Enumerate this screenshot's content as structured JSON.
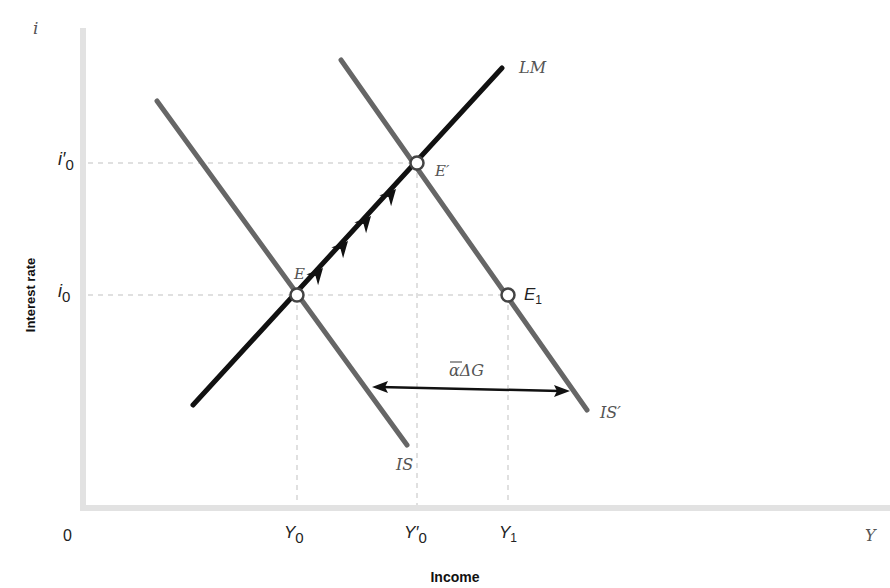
{
  "diagram": {
    "type": "IS-LM",
    "axes": {
      "y_axis_symbol": "i",
      "x_axis_symbol": "Y",
      "origin_label": "0",
      "y_axis_title": "Interest rate",
      "x_axis_title": "Income"
    },
    "y_ticks": [
      {
        "label": "i",
        "sub": "0",
        "prime": "′",
        "name": "i0-prime"
      },
      {
        "label": "i",
        "sub": "0",
        "prime": "",
        "name": "i0"
      }
    ],
    "x_ticks": [
      {
        "label": "Y",
        "sub": "0",
        "prime": "",
        "name": "Y0"
      },
      {
        "label": "Y",
        "sub": "0",
        "prime": "′",
        "name": "Y0-prime"
      },
      {
        "label": "Y",
        "sub": "1",
        "prime": "",
        "name": "Y1"
      }
    ],
    "curves": {
      "LM": "LM",
      "IS": "IS",
      "IS_prime": "IS′"
    },
    "points": {
      "E": "E",
      "E_prime": "E′",
      "E1": "E",
      "E1_sub": "1"
    },
    "shift_label": "αΔG",
    "colors": {
      "lm": "#111111",
      "is": "#666666",
      "axis": "#dddddd",
      "guide": "#d8d8d8"
    }
  }
}
